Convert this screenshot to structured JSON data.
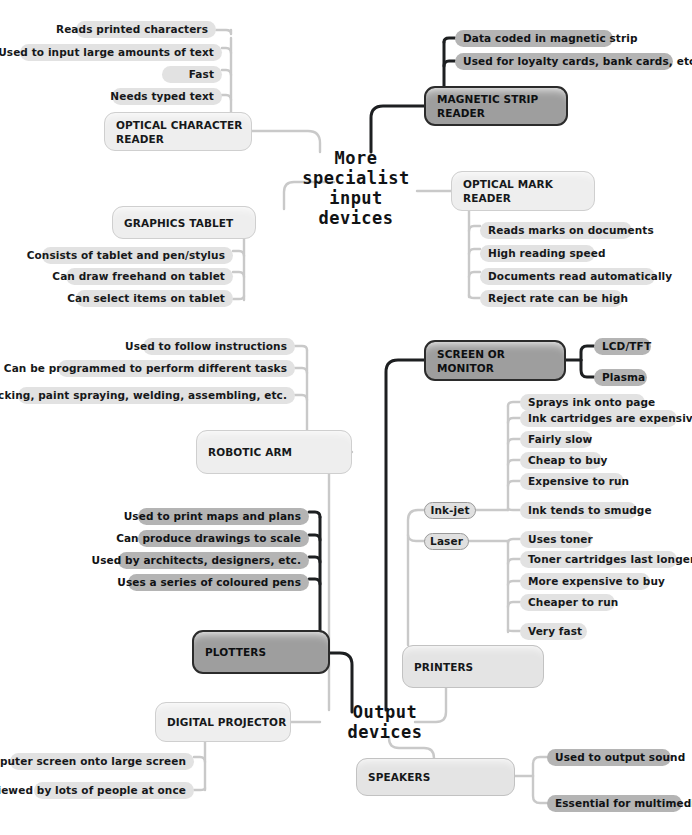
{
  "diagram": {
    "type": "mind-map",
    "title_top": "More\nspecialist\ninput\ndevices",
    "title_bottom": "Output\ndevices",
    "colors": {
      "leaf_light": "#e2e2e2",
      "leaf_dark": "#b4b4b4",
      "box_light": "#e4e4e4",
      "box_pale": "#eeeeee",
      "box_filled": "#9e9e9e",
      "wire_light": "#c9c9c9",
      "wire_dark": "#1d1f21",
      "text": "#16181a",
      "background": "#ffffff"
    }
  },
  "branches": {
    "optical_character_reader": {
      "label_line1": "OPTICAL CHARACTER",
      "label_line2": "READER",
      "leaves": [
        "Reads printed characters",
        "Used to input large amounts of text",
        "Fast",
        "Needs typed text"
      ]
    },
    "magnetic_strip_reader": {
      "label_line1": "MAGNETIC STRIP",
      "label_line2": "READER",
      "leaves": [
        "Data coded in magnetic strip",
        "Used for loyalty cards, bank cards, etc."
      ]
    },
    "graphics_tablet": {
      "label_line1": "GRAPHICS TABLET",
      "leaves": [
        "Consists of tablet and pen/stylus",
        "Can draw freehand on tablet",
        "Can select items on tablet"
      ]
    },
    "optical_mark_reader": {
      "label_line1": "OPTICAL MARK",
      "label_line2": "READER",
      "leaves": [
        "Reads marks on documents",
        "High reading speed",
        "Documents read automatically",
        "Reject rate can be high"
      ]
    },
    "robotic_arm": {
      "label_line1": "ROBOTIC ARM",
      "leaves": [
        "Used to follow instructions",
        "Can be programmed to perform different tasks",
        "Packing, paint spraying, welding, assembling, etc."
      ]
    },
    "screen_or_monitor": {
      "label_line1": "SCREEN OR",
      "label_line2": "MONITOR",
      "leaves": [
        "LCD/TFT",
        "Plasma"
      ]
    },
    "plotters": {
      "label_line1": "PLOTTERS",
      "leaves": [
        "Used to print maps and plans",
        "Can produce drawings to scale",
        "Used by architects, designers, etc.",
        "Uses a series of coloured pens"
      ]
    },
    "printers": {
      "label_line1": "PRINTERS",
      "sub": [
        {
          "label": "Ink-jet",
          "leaves": [
            "Sprays ink onto page",
            "Ink cartridges are expensive",
            "Fairly slow",
            "Cheap to buy",
            "Expensive to run",
            "Ink tends to smudge"
          ]
        },
        {
          "label": "Laser",
          "leaves": [
            "Uses toner",
            "Toner cartridges last longer",
            "More expensive to buy",
            "Cheaper to run",
            "Very fast"
          ]
        }
      ]
    },
    "digital_projector": {
      "label_line1": "DIGITAL PROJECTOR",
      "leaves": [
        "Used to project computer screen onto large screen",
        "Can be viewed by lots of people at once"
      ]
    },
    "speakers": {
      "label_line1": "SPEAKERS",
      "leaves": [
        "Used to output sound",
        "Essential for multimedia"
      ]
    }
  }
}
